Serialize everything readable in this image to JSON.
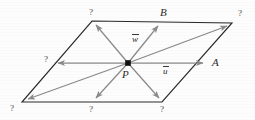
{
  "figure": {
    "type": "vector-diagram",
    "colors": {
      "outline": "#2a2a2a",
      "vector": "#8a8a8a",
      "point": "#111111",
      "label": "#2b2b2b",
      "background": "#fdfdfd"
    },
    "shape": {
      "name": "parallelogram",
      "corners": [
        {
          "name": "top-left",
          "x": 92,
          "y": 21
        },
        {
          "name": "top-right",
          "x": 232,
          "y": 23
        },
        {
          "name": "bottom-right",
          "x": 162,
          "y": 102
        },
        {
          "name": "bottom-left",
          "x": 22,
          "y": 102
        }
      ]
    },
    "origin": {
      "name": "P",
      "x": 128,
      "y": 63
    },
    "vectors": [
      {
        "id": "v-up-left",
        "label": "?",
        "x2": 95,
        "y2": 24,
        "labeled": false
      },
      {
        "id": "v-w",
        "label": "w",
        "x2": 159,
        "y2": 25,
        "labeled": true,
        "overbar": true
      },
      {
        "id": "v-to-top-right",
        "label": "?",
        "x2": 228,
        "y2": 25,
        "labeled": false
      },
      {
        "id": "v-u",
        "label": "u",
        "x2": 205,
        "y2": 63,
        "labeled": true,
        "overbar": true
      },
      {
        "id": "v-down-right",
        "label": "?",
        "x2": 160,
        "y2": 99,
        "labeled": false
      },
      {
        "id": "v-down-left",
        "label": "?",
        "x2": 95,
        "y2": 99,
        "labeled": false
      },
      {
        "id": "v-to-bot-left",
        "label": "?",
        "x2": 26,
        "y2": 100,
        "labeled": false
      },
      {
        "id": "v-left",
        "label": "?",
        "x2": 57,
        "y2": 63,
        "labeled": false
      }
    ],
    "labels": {
      "origin_label": "P",
      "side_a": "A",
      "side_b": "B",
      "vector_u": "u",
      "vector_w": "w",
      "unknown": "?"
    },
    "unknown_markers": [
      {
        "id": "q-top-left",
        "text": "?",
        "x": 89,
        "y": 8
      },
      {
        "id": "q-top-right",
        "text": "?",
        "x": 238,
        "y": 9
      },
      {
        "id": "q-left-middle",
        "text": "?",
        "x": 44,
        "y": 55
      },
      {
        "id": "q-bottom-left",
        "text": "?",
        "x": 10,
        "y": 104
      },
      {
        "id": "q-bottom-middle",
        "text": "?",
        "x": 89,
        "y": 105
      },
      {
        "id": "q-bottom-right",
        "text": "?",
        "x": 160,
        "y": 105
      }
    ]
  }
}
